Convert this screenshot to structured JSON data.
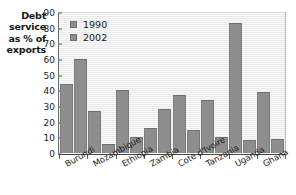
{
  "chart_data": {
    "type": "bar",
    "title": "",
    "subtitle": "",
    "xlabel": "",
    "ylabel": "Debt service as % of exports",
    "ylabel_lines": [
      "Debt",
      "service",
      "as % of",
      "exports"
    ],
    "ylim": [
      0,
      90
    ],
    "ytick_step": 10,
    "yticks": [
      0,
      10,
      20,
      30,
      40,
      50,
      60,
      70,
      80,
      90
    ],
    "ytick_labels": [
      "0",
      "10",
      "20",
      "30",
      "40",
      "50",
      "60",
      "70",
      "80",
      "90"
    ],
    "grid": false,
    "legend_position": "top-left-inside",
    "categories": [
      "Burundi",
      "Mozambique",
      "Ethiopia",
      "Zambia",
      "Cote d'Ivoire",
      "Tanzania",
      "Uganda",
      "Ghana"
    ],
    "series": [
      {
        "name": "1990",
        "color": "#8e8e8e",
        "values": [
          44,
          27,
          40,
          16,
          37,
          34,
          83,
          39
        ]
      },
      {
        "name": "2002",
        "color": "#8e8e8e",
        "values": [
          60,
          6,
          10,
          28,
          15,
          10,
          8,
          9
        ]
      }
    ]
  },
  "colors": {
    "bar": "#8e8e8e",
    "bar_border": "#6f6f6f",
    "plot_background": "#f2f2f2",
    "axis": "#4a4a4a",
    "text": "#161616",
    "page_background": "#ffffff"
  }
}
